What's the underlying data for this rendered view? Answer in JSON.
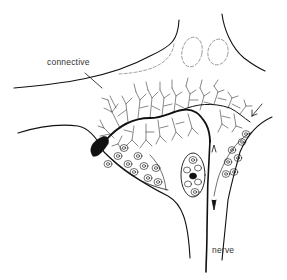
{
  "figure": {
    "labels": {
      "connective": "connective",
      "nerve": "nerve"
    },
    "colors": {
      "ink": "#111111",
      "label": "#333333",
      "dashed": "#777777",
      "background": "#ffffff"
    }
  }
}
